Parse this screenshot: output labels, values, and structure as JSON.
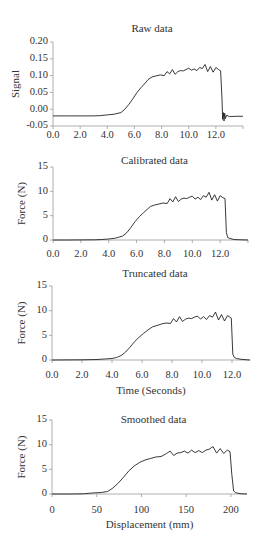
{
  "chart_data": [
    {
      "type": "line",
      "title": "Raw data",
      "xlabel": "",
      "ylabel": "Signal",
      "xlim": [
        0,
        14
      ],
      "ylim": [
        -0.05,
        0.2
      ],
      "xticks": [
        "0.0",
        "2.0",
        "4.0",
        "6.0",
        "8.0",
        "10.0",
        "12.0"
      ],
      "xtick_values": [
        0,
        2,
        4,
        6,
        8,
        10,
        12
      ],
      "yticks": [
        "0.20",
        "0.15",
        "0.10",
        "0.05",
        "0.00",
        "-0.05"
      ],
      "ytick_values": [
        0.2,
        0.15,
        0.1,
        0.05,
        0.0,
        -0.05
      ],
      "grid": false,
      "layout": {
        "x0": 53,
        "x1": 243,
        "xmax_px_value": 14,
        "y_top": 42,
        "y_bottom": 126,
        "title_y": 32,
        "tick_label_y": 138,
        "ylabel_x": 16
      },
      "series": [
        {
          "name": "Raw signal",
          "x": [
            0,
            1,
            2,
            3,
            3.5,
            4,
            4.5,
            5,
            5.3,
            5.6,
            5.9,
            6.2,
            6.5,
            6.8,
            7.0,
            7.3,
            7.6,
            7.9,
            8.2,
            8.4,
            8.6,
            8.8,
            9.0,
            9.2,
            9.4,
            9.6,
            9.8,
            10.0,
            10.2,
            10.4,
            10.6,
            10.8,
            11.0,
            11.2,
            11.4,
            11.6,
            11.8,
            12.0,
            12.2,
            12.35,
            12.45,
            12.5,
            12.55,
            12.6,
            12.65,
            12.7,
            12.8,
            13.0,
            13.5,
            14.0
          ],
          "values": [
            -0.02,
            -0.02,
            -0.02,
            -0.02,
            -0.019,
            -0.017,
            -0.015,
            -0.01,
            0.0,
            0.015,
            0.032,
            0.05,
            0.065,
            0.078,
            0.088,
            0.096,
            0.099,
            0.102,
            0.1,
            0.112,
            0.105,
            0.118,
            0.104,
            0.112,
            0.115,
            0.114,
            0.118,
            0.122,
            0.116,
            0.12,
            0.115,
            0.124,
            0.121,
            0.133,
            0.112,
            0.127,
            0.11,
            0.124,
            0.118,
            0.114,
            0.03,
            -0.03,
            -0.01,
            -0.035,
            -0.012,
            -0.028,
            -0.018,
            -0.022,
            -0.021,
            -0.021
          ]
        }
      ]
    },
    {
      "type": "line",
      "title": "Calibrated data",
      "xlabel": "",
      "ylabel": "Force (N)",
      "xlim": [
        0,
        14
      ],
      "ylim": [
        0,
        15
      ],
      "xticks": [
        "0.0",
        "2.0",
        "4.0",
        "6.0",
        "8.0",
        "10.0",
        "12.0"
      ],
      "xtick_values": [
        0,
        2,
        4,
        6,
        8,
        10,
        12
      ],
      "yticks": [
        "15",
        "10",
        "5",
        "0"
      ],
      "ytick_values": [
        15,
        10,
        5,
        0
      ],
      "grid": false,
      "layout": {
        "x0": 53,
        "x1": 248,
        "xmax_px_value": 14,
        "y_top": 167,
        "y_bottom": 240,
        "title_y": 164,
        "tick_label_y": 257,
        "ylabel_x": 22
      },
      "series": [
        {
          "name": "Force",
          "x": [
            0,
            1,
            2,
            3,
            3.5,
            4,
            4.5,
            5,
            5.3,
            5.6,
            5.9,
            6.2,
            6.5,
            6.8,
            7.0,
            7.3,
            7.6,
            7.9,
            8.2,
            8.4,
            8.6,
            8.8,
            9.0,
            9.2,
            9.4,
            9.6,
            9.8,
            10.0,
            10.2,
            10.4,
            10.6,
            10.8,
            11.0,
            11.2,
            11.4,
            11.6,
            11.8,
            12.0,
            12.2,
            12.35,
            12.45,
            12.55,
            12.7,
            13.0,
            13.5,
            14.0
          ],
          "values": [
            0,
            0,
            0.02,
            0.05,
            0.1,
            0.2,
            0.4,
            0.8,
            1.5,
            2.6,
            3.8,
            4.8,
            5.6,
            6.4,
            6.9,
            7.2,
            7.4,
            7.6,
            7.5,
            8.5,
            7.8,
            8.9,
            7.9,
            8.4,
            8.6,
            8.5,
            8.8,
            9.0,
            8.4,
            8.8,
            8.3,
            9.1,
            8.8,
            9.8,
            8.2,
            9.3,
            8.0,
            9.1,
            8.7,
            8.5,
            1.5,
            0.5,
            0.3,
            0.1,
            0.05,
            0.0
          ]
        }
      ]
    },
    {
      "type": "line",
      "title": "Truncated data",
      "xlabel": "Time (Seconds)",
      "ylabel": "Force (N)",
      "xlim": [
        0,
        13.2
      ],
      "ylim": [
        0,
        15
      ],
      "xticks": [
        "0.0",
        "2.0",
        "4.0",
        "6.0",
        "8.0",
        "10.0",
        "12.0"
      ],
      "xtick_values": [
        0,
        2,
        4,
        6,
        8,
        10,
        12
      ],
      "yticks": [
        "15",
        "10",
        "5",
        "0"
      ],
      "ytick_values": [
        15,
        10,
        5,
        0
      ],
      "grid": false,
      "layout": {
        "x0": 52,
        "x1": 250,
        "xmax_px_value": 13.2,
        "y_top": 286,
        "y_bottom": 360,
        "title_y": 277,
        "tick_label_y": 378,
        "ylabel_x": 22,
        "xlabel_y": 394
      },
      "series": [
        {
          "name": "Force",
          "x": [
            0,
            1,
            2,
            3,
            3.5,
            4,
            4.3,
            4.6,
            4.9,
            5.2,
            5.5,
            5.8,
            6.1,
            6.4,
            6.7,
            7.0,
            7.3,
            7.6,
            7.9,
            8.1,
            8.3,
            8.5,
            8.7,
            8.9,
            9.1,
            9.3,
            9.5,
            9.7,
            9.9,
            10.1,
            10.3,
            10.5,
            10.7,
            10.9,
            11.1,
            11.3,
            11.5,
            11.7,
            11.85,
            11.95,
            12.05,
            12.15,
            12.3,
            12.6,
            13.0,
            13.2
          ],
          "values": [
            0,
            0.02,
            0.05,
            0.1,
            0.2,
            0.3,
            0.5,
            0.9,
            1.6,
            2.6,
            3.7,
            4.6,
            5.4,
            6.1,
            6.7,
            7.0,
            7.3,
            7.5,
            7.4,
            8.4,
            7.7,
            8.8,
            7.8,
            8.3,
            8.5,
            8.4,
            8.7,
            8.9,
            8.3,
            8.8,
            8.2,
            9.0,
            8.7,
            9.7,
            8.1,
            9.2,
            7.9,
            9.0,
            8.7,
            8.5,
            1.2,
            0.5,
            0.3,
            0.15,
            0.05,
            0.0
          ]
        }
      ]
    },
    {
      "type": "line",
      "title": "Smoothed data",
      "xlabel": "Displacement (mm)",
      "ylabel": "Force (N)",
      "xlim": [
        0,
        218
      ],
      "ylim": [
        0,
        15
      ],
      "xticks": [
        "0",
        "50",
        "100",
        "150",
        "200"
      ],
      "xtick_values": [
        0,
        50,
        100,
        150,
        200
      ],
      "yticks": [
        "15",
        "10",
        "5",
        "0"
      ],
      "ytick_values": [
        15,
        10,
        5,
        0
      ],
      "grid": false,
      "layout": {
        "x0": 52,
        "x1": 247,
        "xmax_px_value": 218,
        "y_top": 420,
        "y_bottom": 494,
        "title_y": 423,
        "tick_label_y": 513,
        "ylabel_x": 22,
        "xlabel_y": 528
      },
      "series": [
        {
          "name": "Force (smoothed)",
          "x": [
            0,
            20,
            35,
            45,
            55,
            62,
            68,
            74,
            80,
            86,
            92,
            98,
            104,
            110,
            116,
            122,
            128,
            132,
            136,
            140,
            144,
            148,
            152,
            156,
            160,
            164,
            168,
            172,
            176,
            180,
            184,
            188,
            192,
            196,
            199,
            201,
            203,
            205,
            208,
            212,
            218
          ],
          "values": [
            0,
            0,
            0.05,
            0.2,
            0.3,
            0.5,
            1.2,
            2.2,
            3.4,
            4.7,
            5.7,
            6.4,
            6.9,
            7.2,
            7.5,
            7.6,
            8.2,
            8.7,
            7.8,
            8.3,
            8.4,
            8.7,
            8.3,
            8.9,
            8.4,
            8.8,
            8.4,
            8.9,
            9.1,
            9.6,
            8.3,
            9.2,
            8.2,
            8.9,
            8.6,
            4.0,
            0.6,
            0.3,
            0.15,
            0.05,
            0.0
          ]
        }
      ]
    }
  ],
  "colors": {
    "curve": "#222222",
    "axis": "#9a9a9a",
    "text": "#333333",
    "background": "#ffffff"
  }
}
